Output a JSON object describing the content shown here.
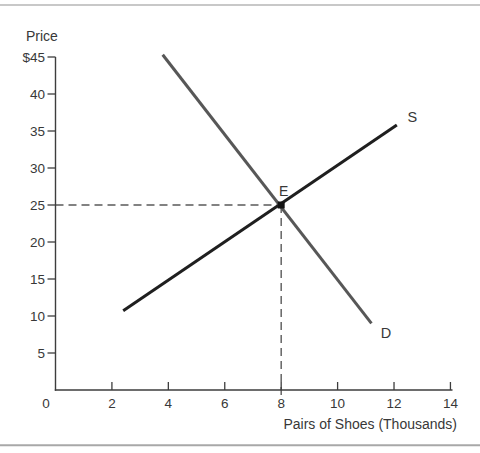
{
  "figure": {
    "background": "#ffffff",
    "top_rule_color": "#b6b6b6",
    "bottom_rule_color": "#a8a8a8"
  },
  "chart_data": {
    "type": "line",
    "title": "",
    "ylabel": "Price",
    "xlabel": "Pairs of Shoes (Thousands)",
    "xlim": [
      0,
      14
    ],
    "ylim": [
      0,
      45
    ],
    "grid": false,
    "legend": "inline-labels-at-line-ends",
    "origin_label": "0",
    "x_ticks": [
      2,
      4,
      6,
      8,
      10,
      12,
      14
    ],
    "x_tick_labels": [
      "2",
      "4",
      "6",
      "8",
      "10",
      "12",
      "14"
    ],
    "y_ticks": [
      45,
      40,
      35,
      30,
      25,
      20,
      15,
      10,
      5
    ],
    "y_tick_labels": [
      "$45",
      "40",
      "35",
      "30",
      "25",
      "20",
      "15",
      "10",
      "5"
    ],
    "axis_color": "#3d3d3d",
    "text_color": "#383838",
    "dash_color": "#5a5a5a",
    "series": [
      {
        "name": "S",
        "kind": "supply",
        "color": "#1f1f1f",
        "points": [
          [
            2.4,
            10.7
          ],
          [
            12.1,
            35.8
          ]
        ]
      },
      {
        "name": "D",
        "kind": "demand",
        "color": "#575757",
        "points": [
          [
            3.8,
            45.3
          ],
          [
            11.2,
            9.0
          ]
        ]
      }
    ],
    "equilibrium": {
      "label": "E",
      "x": 8,
      "y": 25,
      "marker": "filled-square",
      "marker_color": "#141414"
    },
    "dashed_guides": [
      {
        "orient": "horizontal",
        "at_y": 25,
        "from_x": 0,
        "to_x": 8
      },
      {
        "orient": "vertical",
        "at_x": 8,
        "from_y": 0,
        "to_y": 25
      }
    ]
  }
}
